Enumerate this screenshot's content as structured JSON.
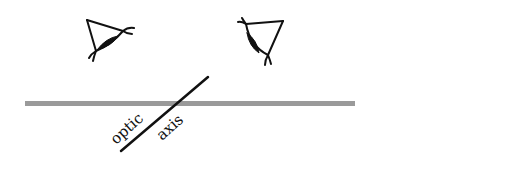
{
  "diagram": {
    "labels": {
      "optic": "optic",
      "axis": "axis"
    },
    "colors": {
      "stroke": "#111111",
      "plate": "#9a9a9a",
      "background": "#ffffff"
    },
    "elements": {
      "left_eye": "eye-icon",
      "right_eye": "eye-icon",
      "plate": "horizontal crystal plate",
      "optic_axis": "inclined line"
    }
  }
}
